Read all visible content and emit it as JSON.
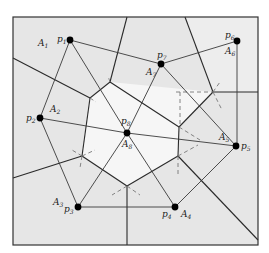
{
  "figure": {
    "colors": {
      "background": "#ffffff",
      "outer_cell": "#e4e4e4",
      "center_cell": "#f4f4f4",
      "voronoi_edge": "#2a2a2a",
      "delaunay_edge": "#3a3a3a",
      "dashed": "#777777",
      "site": "#000000"
    },
    "sites": [
      {
        "id": "p1",
        "base": "p",
        "index": "1",
        "area_label": "A",
        "area_index": "1"
      },
      {
        "id": "p2",
        "base": "p",
        "index": "2",
        "area_label": "A",
        "area_index": "2"
      },
      {
        "id": "p3",
        "base": "p",
        "index": "3",
        "area_label": "A",
        "area_index": "3"
      },
      {
        "id": "p4",
        "base": "p",
        "index": "4",
        "area_label": "A",
        "area_index": "4"
      },
      {
        "id": "p5",
        "base": "p",
        "index": "5",
        "area_label": "A",
        "area_index": "5"
      },
      {
        "id": "p6",
        "base": "p",
        "index": "6",
        "area_label": "A",
        "area_index": "6"
      },
      {
        "id": "p7",
        "base": "p",
        "index": "7",
        "area_label": "A",
        "area_index": "7"
      },
      {
        "id": "p8",
        "base": "p",
        "index": "8",
        "area_label": "A",
        "area_index": "8"
      }
    ],
    "delaunay_edges": [
      [
        "p1",
        "p2"
      ],
      [
        "p1",
        "p8"
      ],
      [
        "p2",
        "p8"
      ],
      [
        "p2",
        "p3"
      ],
      [
        "p3",
        "p8"
      ],
      [
        "p3",
        "p4"
      ],
      [
        "p4",
        "p8"
      ],
      [
        "p4",
        "p5"
      ],
      [
        "p5",
        "p8"
      ],
      [
        "p5",
        "p7"
      ],
      [
        "p7",
        "p8"
      ],
      [
        "p1",
        "p7"
      ],
      [
        "p7",
        "p6"
      ],
      [
        "p6",
        "p5"
      ]
    ]
  }
}
